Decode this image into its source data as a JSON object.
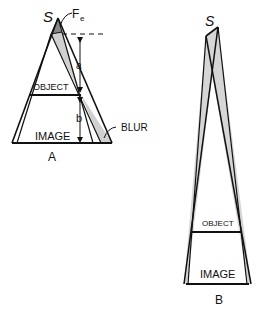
{
  "figure": {
    "panel_a": {
      "caption": "A",
      "source_label": "S",
      "focal_spot_label": "F",
      "focal_spot_subscript": "e",
      "object_label": "OBJECT",
      "image_label": "IMAGE",
      "distance_a_label": "a",
      "distance_b_label": "b",
      "blur_label": "BLUR"
    },
    "panel_b": {
      "caption": "B",
      "source_label": "S",
      "object_label": "OBJECT",
      "image_label": "IMAGE"
    },
    "colors": {
      "line": "#111111",
      "penumbra_fill": "#cfcfcf",
      "background": "#ffffff"
    }
  }
}
